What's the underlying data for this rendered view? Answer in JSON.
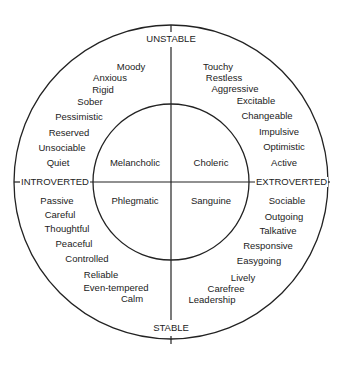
{
  "axes": {
    "top": "UNSTABLE",
    "bottom": "STABLE",
    "left": "INTROVERTED",
    "right": "EXTROVERTED"
  },
  "temperaments": {
    "top_left": "Melancholic",
    "top_right": "Choleric",
    "bottom_left": "Phlegmatic",
    "bottom_right": "Sanguine"
  },
  "traits": {
    "top_left": [
      "Moody",
      "Anxious",
      "Rigid",
      "Sober",
      "Pessimistic",
      "Reserved",
      "Unsociable",
      "Quiet"
    ],
    "top_right": [
      "Touchy",
      "Restless",
      "Aggressive",
      "Excitable",
      "Changeable",
      "Impulsive",
      "Optimistic",
      "Active"
    ],
    "bottom_left": [
      "Passive",
      "Careful",
      "Thoughtful",
      "Peaceful",
      "Controlled",
      "Reliable",
      "Even-tempered",
      "Calm"
    ],
    "bottom_right": [
      "Sociable",
      "Outgoing",
      "Talkative",
      "Responsive",
      "Easygoing",
      "Lively",
      "Carefree",
      "Leadership"
    ]
  }
}
